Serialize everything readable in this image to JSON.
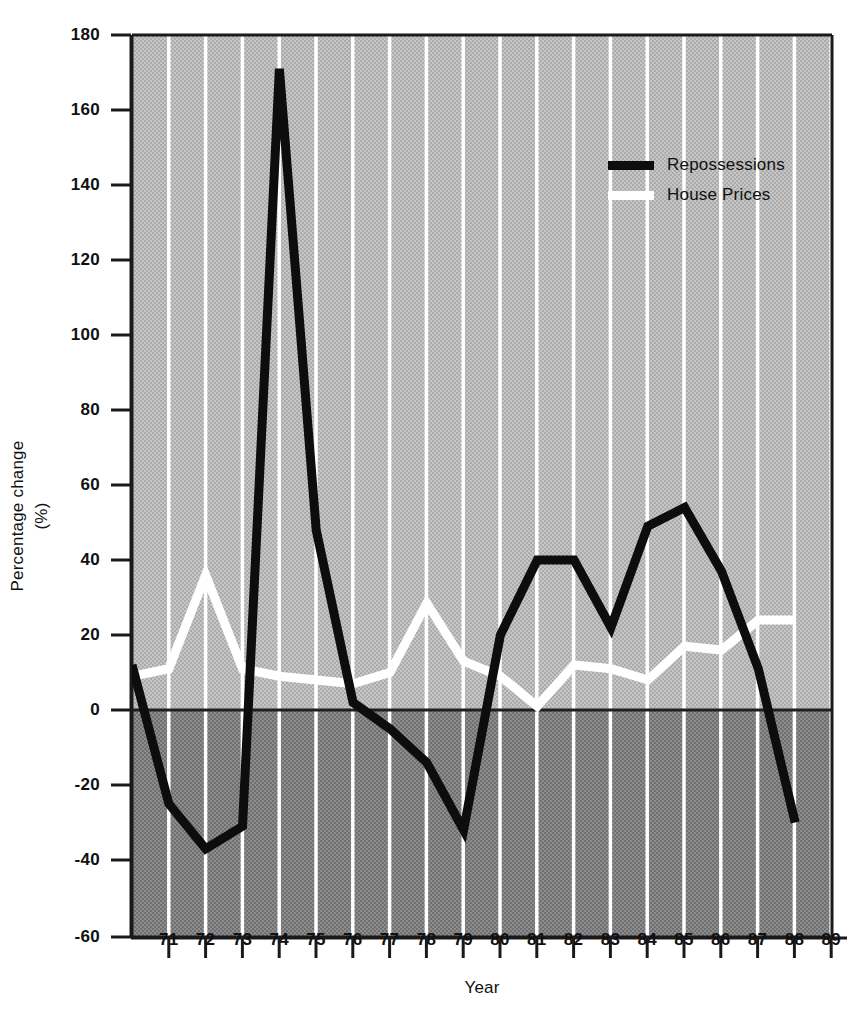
{
  "chart_data": {
    "type": "line",
    "title": "",
    "xlabel": "Year",
    "ylabel": "Percentage change",
    "ylabel_units": "(%)",
    "xlim": [
      70.0,
      89.0
    ],
    "ylim": [
      -60,
      180
    ],
    "yticks": [
      180,
      160,
      140,
      120,
      100,
      80,
      60,
      40,
      20,
      0,
      -20,
      -40,
      -60
    ],
    "ytick_labels": [
      "180",
      "160",
      "140",
      "120",
      "100",
      "80",
      "60",
      "40",
      "20",
      "0",
      "-20",
      "-40",
      "-60"
    ],
    "xticks": [
      71,
      72,
      73,
      74,
      75,
      76,
      77,
      78,
      79,
      80,
      81,
      82,
      83,
      84,
      85,
      86,
      87,
      88,
      89
    ],
    "xtick_labels": [
      "71",
      "72",
      "73",
      "74",
      "75",
      "76",
      "77",
      "78",
      "79",
      "80",
      "81",
      "82",
      "83",
      "84",
      "85",
      "86",
      "87",
      "88",
      "89"
    ],
    "grid": "vertical-white-gridlines",
    "legend_position": "upper-right-inside",
    "x": [
      70.0,
      71,
      72,
      73,
      74,
      75,
      76,
      77,
      78,
      79,
      80,
      81,
      82,
      83,
      84,
      85,
      86,
      87,
      88
    ],
    "series": [
      {
        "name": "Repossessions",
        "color": "#0d0d0d",
        "values": [
          12,
          -25,
          -37,
          -31,
          171,
          48,
          2,
          -5,
          -14,
          -32,
          20,
          40,
          40,
          22,
          49,
          54,
          37,
          11,
          -30
        ]
      },
      {
        "name": "House Prices",
        "color": "#ffffff",
        "values": [
          9,
          11,
          36,
          11,
          9,
          8,
          7,
          10,
          28.5,
          13,
          9,
          1,
          12,
          11,
          8,
          17,
          16,
          24,
          24
        ]
      }
    ],
    "annotations": {
      "zero_line": 0,
      "below_zero_shading": "#808080",
      "above_zero_shading": "#b9b9b9"
    }
  },
  "legend": {
    "items": [
      {
        "label": "Repossessions",
        "swatch": "black"
      },
      {
        "label": "House Prices",
        "swatch": "white"
      }
    ]
  },
  "colors": {
    "plot_upper_bg": "#b9b9b9",
    "plot_lower_bg": "#808080",
    "gridline": "#ffffff",
    "axis": "#1a1a1a",
    "repossessions": "#0d0d0d",
    "house_prices": "#ffffff",
    "page_bg": "#ffffff"
  }
}
